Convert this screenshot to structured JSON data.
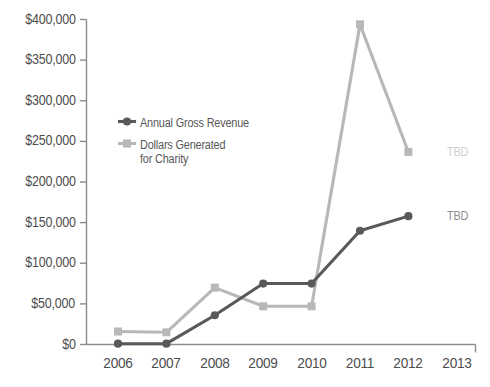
{
  "chart_data": {
    "type": "line",
    "title": "",
    "xlabel": "",
    "ylabel": "",
    "categories": [
      "2006",
      "2007",
      "2008",
      "2009",
      "2010",
      "2011",
      "2012",
      "2013"
    ],
    "ylim": [
      0,
      400000
    ],
    "ytick_values": [
      0,
      50000,
      100000,
      150000,
      200000,
      250000,
      300000,
      350000,
      400000
    ],
    "ytick_labels": [
      "$0",
      "$50,000",
      "$100,000",
      "$150,000",
      "$200,000",
      "$250,000",
      "$300,000",
      "$350,000",
      "$400,000"
    ],
    "grid": false,
    "legend_position": "upper-left-inside",
    "series": [
      {
        "name": "Annual Gross Revenue",
        "color": "#595959",
        "marker": "circle",
        "x": [
          "2006",
          "2007",
          "2008",
          "2009",
          "2010",
          "2011",
          "2012"
        ],
        "values": [
          1000,
          1000,
          36000,
          75000,
          75000,
          140000,
          158000
        ]
      },
      {
        "name": "Dollars Generated for Charity",
        "color": "#b8b8b8",
        "marker": "square",
        "x": [
          "2006",
          "2007",
          "2008",
          "2009",
          "2010",
          "2011",
          "2012"
        ],
        "values": [
          16000,
          15000,
          70000,
          47000,
          47000,
          394000,
          237000
        ]
      }
    ],
    "annotations": [
      {
        "text": "TBD",
        "x": "2013",
        "value": 237000,
        "color": "#cfcfcf",
        "series": "Dollars Generated for Charity"
      },
      {
        "text": "TBD",
        "x": "2013",
        "value": 158000,
        "color": "#8c8c8c",
        "series": "Annual Gross Revenue"
      }
    ]
  },
  "legend": {
    "entries": [
      {
        "label": "Annual Gross Revenue",
        "label_line2": ""
      },
      {
        "label": "Dollars Generated",
        "label_line2": "for Charity"
      }
    ]
  },
  "axis": {
    "line_color": "#8c8c8c",
    "tick_color": "#8c8c8c"
  }
}
